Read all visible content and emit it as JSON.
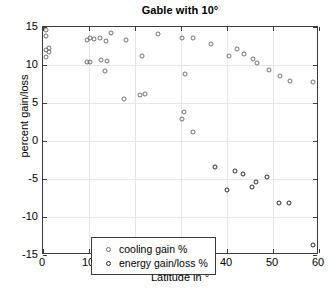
{
  "chart_data": {
    "type": "scatter",
    "title": "Gable with 10°",
    "xlabel": "Latitude in °",
    "ylabel": "percent gain/loss",
    "xlim": [
      0,
      60
    ],
    "ylim": [
      -15,
      15
    ],
    "xticks": [
      0,
      10,
      20,
      30,
      40,
      50,
      60
    ],
    "yticks": [
      -15,
      -10,
      -5,
      0,
      5,
      10,
      15
    ],
    "grid": true,
    "legend_position": "lower left",
    "series": [
      {
        "name": "cooling gain %",
        "marker": "open-circle",
        "color": "#6e6e6e",
        "points": [
          [
            0.6,
            14.6
          ],
          [
            0.6,
            13.8
          ],
          [
            0.6,
            12.0
          ],
          [
            1.4,
            12.3
          ],
          [
            1.4,
            11.7
          ],
          [
            0.6,
            11.0
          ],
          [
            9.6,
            13.3
          ],
          [
            10.2,
            13.5
          ],
          [
            11.0,
            13.4
          ],
          [
            9.6,
            10.4
          ],
          [
            10.2,
            10.4
          ],
          [
            12.4,
            13.5
          ],
          [
            13.8,
            13.2
          ],
          [
            14.8,
            14.2
          ],
          [
            12.6,
            10.6
          ],
          [
            14.0,
            10.5
          ],
          [
            13.4,
            9.2
          ],
          [
            18.0,
            13.3
          ],
          [
            17.6,
            5.5
          ],
          [
            21.6,
            11.2
          ],
          [
            21.0,
            6.0
          ],
          [
            22.2,
            6.2
          ],
          [
            25.0,
            14.1
          ],
          [
            30.2,
            13.5
          ],
          [
            30.8,
            8.8
          ],
          [
            32.6,
            13.5
          ],
          [
            30.6,
            3.8
          ],
          [
            30.2,
            2.9
          ],
          [
            32.6,
            1.2
          ],
          [
            36.6,
            12.8
          ],
          [
            40.4,
            11.2
          ],
          [
            42.2,
            12.1
          ],
          [
            43.8,
            11.4
          ],
          [
            45.6,
            10.8
          ],
          [
            46.6,
            10.2
          ],
          [
            49.2,
            9.3
          ],
          [
            51.6,
            8.5
          ],
          [
            53.6,
            7.9
          ],
          [
            58.8,
            7.8
          ]
        ]
      },
      {
        "name": "energy gain/loss %",
        "marker": "open-circle",
        "color": "#2b2b2b",
        "points": [
          [
            37.4,
            -3.4
          ],
          [
            40.0,
            -6.4
          ],
          [
            41.8,
            -3.9
          ],
          [
            43.4,
            -4.3
          ],
          [
            45.4,
            -6.0
          ],
          [
            46.2,
            -5.4
          ],
          [
            48.8,
            -4.8
          ],
          [
            51.4,
            -8.2
          ],
          [
            53.4,
            -8.1
          ],
          [
            58.8,
            -13.7
          ]
        ]
      }
    ]
  },
  "legend": {
    "items": [
      {
        "label": "cooling gain %",
        "key": "cooling"
      },
      {
        "label": "energy gain/loss %",
        "key": "energy"
      }
    ]
  },
  "axis_tick_labels": {
    "y": [
      "15",
      "10",
      "5",
      "0",
      "-5",
      "-10",
      "-15"
    ],
    "x": [
      "0",
      "10",
      "20",
      "30",
      "40",
      "50",
      "60"
    ]
  }
}
